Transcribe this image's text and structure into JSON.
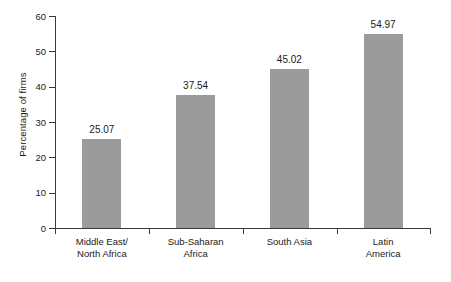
{
  "chart_data": {
    "type": "bar",
    "title": "",
    "xlabel": "",
    "ylabel": "Percentage of firms",
    "ylim": [
      0,
      60
    ],
    "yticks": [
      "0",
      "10",
      "20",
      "30",
      "40",
      "50",
      "60"
    ],
    "grid": false,
    "legend": null,
    "categories": [
      "Middle East/ North Africa",
      "Sub-Saharan Africa",
      "South Asia",
      "Latin America"
    ],
    "category_lines": [
      [
        "Middle East/",
        "North Africa"
      ],
      [
        "Sub-Saharan",
        "Africa"
      ],
      [
        "South Asia"
      ],
      [
        "Latin",
        "America"
      ]
    ],
    "values": [
      25.07,
      37.54,
      45.02,
      54.97
    ],
    "value_labels": [
      "25.07",
      "37.54",
      "45.02",
      "54.97"
    ],
    "bar_color": "#9b9b9b",
    "axis_color": "#3a3a3a",
    "background": "#ffffff"
  }
}
